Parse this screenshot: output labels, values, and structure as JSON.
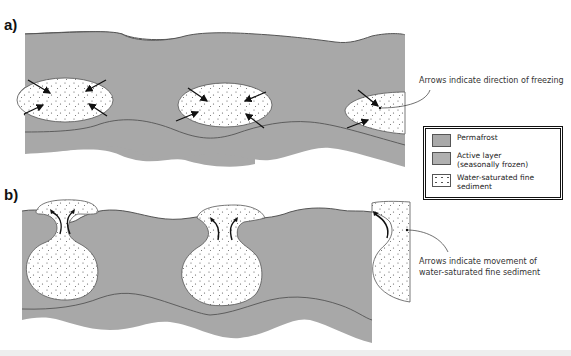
{
  "panels": {
    "a": {
      "label": "a)",
      "annotation": "Arrows indicate direction of freezing"
    },
    "b": {
      "label": "b)",
      "annotation_line1": "Arrows indicate movement of",
      "annotation_line2": "water-saturated fine sediment"
    }
  },
  "legend": {
    "items": [
      {
        "label": "Permafrost",
        "label2": "",
        "color": "#a9a9a9"
      },
      {
        "label": "Active layer",
        "label2": "(seasonally frozen)",
        "color": "#b0b0b0"
      },
      {
        "label": "Water-saturated fine",
        "label2": "sediment",
        "color": "#ffffff"
      }
    ]
  },
  "colors": {
    "ground": "#a8a8a8",
    "boundary_line": "#555555",
    "sediment_fill": "#ffffff",
    "arrow": "#111111"
  }
}
